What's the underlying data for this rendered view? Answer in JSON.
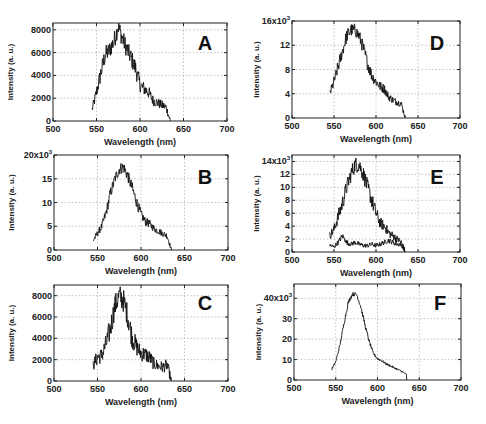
{
  "figure": {
    "xlabel": "Wavelength (nm)",
    "ylabel": "Intensity (a. u.)"
  },
  "chart_data": [
    {
      "panel": "A",
      "type": "line",
      "xlabel": "Wavelength (nm)",
      "ylabel": "Intensity (a. u.)",
      "xlim": [
        500,
        700
      ],
      "ylim": [
        0,
        8600
      ],
      "xticks": [
        500,
        550,
        600,
        650,
        700
      ],
      "yticks": [
        0,
        2000,
        4000,
        6000,
        8000
      ],
      "ytick_labels": [
        "0",
        "2000",
        "4000",
        "6000",
        "8000"
      ],
      "grid": true,
      "x": [
        545,
        550,
        555,
        560,
        565,
        570,
        575,
        580,
        585,
        590,
        595,
        600,
        605,
        610,
        615,
        620,
        625,
        630,
        635
      ],
      "values": [
        1000,
        2500,
        4200,
        5800,
        6200,
        7000,
        8300,
        7200,
        6300,
        5500,
        4600,
        3200,
        2800,
        2500,
        1800,
        1600,
        1400,
        1200,
        0
      ],
      "noise": 1600
    },
    {
      "panel": "B",
      "type": "line",
      "xlabel": "Wavelength (nm)",
      "ylabel": "Intensity (a. u.)",
      "xlim": [
        500,
        700
      ],
      "ylim": [
        0,
        20000
      ],
      "xticks": [
        500,
        550,
        600,
        650,
        700
      ],
      "yticks": [
        0,
        5000,
        10000,
        15000,
        20000
      ],
      "ytick_labels": [
        "0",
        "5",
        "10",
        "15",
        "20x10³"
      ],
      "grid": true,
      "x": [
        545,
        550,
        555,
        560,
        565,
        570,
        575,
        580,
        585,
        590,
        595,
        600,
        605,
        610,
        615,
        620,
        625,
        630,
        635
      ],
      "values": [
        2000,
        3500,
        5000,
        8000,
        12000,
        15000,
        17000,
        17500,
        15500,
        13000,
        10000,
        7500,
        6000,
        5500,
        4500,
        4000,
        3500,
        3000,
        0
      ],
      "noise": 2500
    },
    {
      "panel": "C",
      "type": "line",
      "xlabel": "Wavelength (nm)",
      "ylabel": "Intensity (a. u.)",
      "xlim": [
        500,
        700
      ],
      "ylim": [
        0,
        9000
      ],
      "xticks": [
        500,
        550,
        600,
        650,
        700
      ],
      "yticks": [
        0,
        2000,
        4000,
        6000,
        8000
      ],
      "ytick_labels": [
        "0",
        "2000",
        "4000",
        "6000",
        "8000"
      ],
      "grid": true,
      "x": [
        545,
        550,
        555,
        560,
        565,
        570,
        575,
        580,
        585,
        590,
        595,
        600,
        605,
        610,
        615,
        620,
        625,
        630,
        635
      ],
      "values": [
        1500,
        2200,
        2400,
        3500,
        5000,
        7000,
        8000,
        7500,
        6000,
        4000,
        3200,
        2600,
        2500,
        2200,
        1600,
        1400,
        1300,
        1500,
        0
      ],
      "noise": 2200
    },
    {
      "panel": "D",
      "type": "line",
      "xlabel": "Wavelength (nm)",
      "ylabel": "Intensity (a. u.)",
      "xlim": [
        500,
        700
      ],
      "ylim": [
        0,
        16000
      ],
      "xticks": [
        500,
        550,
        600,
        650,
        700
      ],
      "yticks": [
        0,
        4000,
        8000,
        12000,
        16000
      ],
      "ytick_labels": [
        "0",
        "4",
        "8",
        "12",
        "16x10³"
      ],
      "grid": true,
      "x": [
        545,
        550,
        555,
        560,
        565,
        570,
        575,
        580,
        585,
        590,
        595,
        600,
        605,
        610,
        615,
        620,
        625,
        630,
        635
      ],
      "values": [
        4000,
        6000,
        8500,
        11000,
        13500,
        14500,
        14500,
        13500,
        11500,
        9000,
        7000,
        6000,
        5200,
        4800,
        3500,
        3000,
        2600,
        2400,
        0
      ],
      "noise": 2200
    },
    {
      "panel": "E",
      "type": "line",
      "xlabel": "Wavelength (nm)",
      "ylabel": "Intensity (a. u.)",
      "xlim": [
        500,
        700
      ],
      "ylim": [
        0,
        15000
      ],
      "xticks": [
        500,
        550,
        600,
        650,
        700
      ],
      "yticks": [
        0,
        2000,
        4000,
        6000,
        8000,
        10000,
        12000,
        14000
      ],
      "ytick_labels": [
        "0",
        "2",
        "4",
        "6",
        "8",
        "10",
        "12",
        "14x10³"
      ],
      "grid": true,
      "series": [
        {
          "name": "trace-1",
          "x": [
            545,
            550,
            555,
            560,
            565,
            570,
            575,
            580,
            585,
            590,
            595,
            600,
            605,
            610,
            615,
            620,
            625,
            630,
            635
          ],
          "values": [
            2500,
            3500,
            5500,
            7500,
            10000,
            12000,
            13500,
            13500,
            12000,
            10000,
            8000,
            6000,
            4500,
            4000,
            3000,
            2500,
            2000,
            1500,
            0
          ]
        },
        {
          "name": "trace-2",
          "x": [
            545,
            550,
            555,
            560,
            565,
            570,
            575,
            580,
            585,
            590,
            595,
            600,
            605,
            610,
            615,
            620,
            625,
            630,
            635
          ],
          "values": [
            1000,
            800,
            1500,
            2500,
            1500,
            1200,
            1500,
            1200,
            1000,
            1000,
            1200,
            1000,
            1200,
            1500,
            1800,
            1500,
            1200,
            1200,
            0
          ]
        }
      ],
      "noise": 2500
    },
    {
      "panel": "F",
      "type": "line",
      "xlabel": "Wavelength (nm)",
      "ylabel": "Intensity (a. u.)",
      "xlim": [
        500,
        700
      ],
      "ylim": [
        0,
        47000
      ],
      "xticks": [
        500,
        550,
        600,
        650,
        700
      ],
      "yticks": [
        0,
        10000,
        20000,
        30000,
        40000
      ],
      "ytick_labels": [
        "0",
        "10",
        "20",
        "30",
        "40x10³"
      ],
      "grid": true,
      "x": [
        545,
        550,
        555,
        560,
        565,
        570,
        575,
        580,
        585,
        590,
        595,
        600,
        605,
        610,
        615,
        620,
        625,
        630,
        635
      ],
      "values": [
        5000,
        9000,
        17000,
        28000,
        38000,
        42000,
        42000,
        36000,
        27000,
        19000,
        13000,
        10500,
        9500,
        8000,
        7000,
        6000,
        5000,
        4000,
        2500
      ],
      "noise": 2000
    }
  ],
  "layout": {
    "panels": [
      {
        "panel": "A",
        "box": [
          53,
          23,
          227,
          121
        ],
        "letter_pos": [
          205,
          50
        ]
      },
      {
        "panel": "B",
        "box": [
          54,
          155,
          228,
          250
        ],
        "letter_pos": [
          205,
          184
        ]
      },
      {
        "panel": "C",
        "box": [
          54,
          285,
          228,
          381
        ],
        "letter_pos": [
          205,
          310
        ]
      },
      {
        "panel": "D",
        "box": [
          292,
          21,
          460,
          118
        ],
        "letter_pos": [
          437,
          50
        ]
      },
      {
        "panel": "E",
        "box": [
          292,
          155,
          460,
          252
        ],
        "letter_pos": [
          437,
          184
        ]
      },
      {
        "panel": "F",
        "box": [
          294,
          284,
          461,
          380
        ],
        "letter_pos": [
          440,
          310
        ]
      }
    ]
  }
}
